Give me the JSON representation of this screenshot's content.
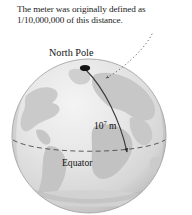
{
  "figure": {
    "caption": "The meter was originally defined as 1/10,000,000 of this distance.",
    "labels": {
      "north_pole": "North Pole",
      "equator": "Equator",
      "distance_base": "10",
      "distance_exponent": "7",
      "distance_unit": "m"
    },
    "colors": {
      "background": "#ffffff",
      "ocean": "#e4e4e4",
      "ocean_highlight": "#f2f2f2",
      "land": "#c9c9c9",
      "terminator_shadow": "#b4b4b4",
      "outline": "#a9a9a9",
      "text": "#111111",
      "arc": "#3a3a3a",
      "pole_marker": "#111111",
      "equator_dash": "#4a4a4a",
      "leader_dots": "#707070"
    },
    "annotations": {
      "pole_marker": "black ellipse dot at the north pole",
      "measured_arc": "curved arrow from North Pole down to Equator",
      "equator_line": "dashed ellipse arc across the globe",
      "leader_line": "dotted curved line from caption to the measured arc"
    }
  }
}
